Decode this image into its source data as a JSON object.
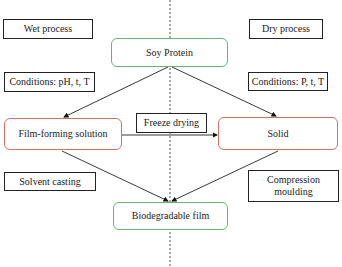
{
  "diagram": {
    "divider": "dashed vertical line",
    "left_label": "Wet process",
    "right_label": "Dry process",
    "nodes": {
      "soy_protein": "Soy Protein",
      "film_forming": "Film-forming solution",
      "solid": "Solid",
      "biodegradable": "Biodegradable film"
    },
    "annotations": {
      "wet_conditions": "Conditions: pH, t, T",
      "dry_conditions": "Conditions: P, t, T",
      "freeze_drying": "Freeze drying",
      "solvent_casting": "Solvent casting",
      "compression_moulding": "Compression moulding"
    },
    "colors": {
      "start_end_border": "#6fb07a",
      "intermediate_border": "#d0706a",
      "label_border": "#222222",
      "divider": "#555555"
    },
    "edges": [
      {
        "from": "Soy Protein",
        "to": "Film-forming solution"
      },
      {
        "from": "Soy Protein",
        "to": "Solid"
      },
      {
        "from": "Film-forming solution",
        "to": "Solid",
        "label": "Freeze drying"
      },
      {
        "from": "Film-forming solution",
        "to": "Biodegradable film"
      },
      {
        "from": "Solid",
        "to": "Biodegradable film"
      }
    ]
  }
}
